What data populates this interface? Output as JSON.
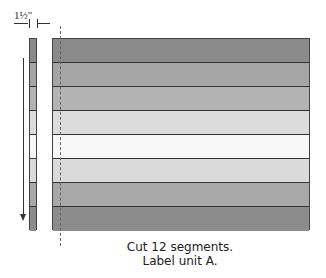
{
  "dimension": {
    "label": "1½\""
  },
  "rows": [
    {
      "color": "#8a8a8a"
    },
    {
      "color": "#a5a5a5"
    },
    {
      "color": "#b3b3b3"
    },
    {
      "color": "#dcdcdc"
    },
    {
      "color": "#f8f8f8"
    },
    {
      "color": "#dadada"
    },
    {
      "color": "#a8a8a8"
    },
    {
      "color": "#8c8c8c"
    }
  ],
  "caption": {
    "line1": "Cut 12 segments.",
    "line2": "Label unit A."
  }
}
